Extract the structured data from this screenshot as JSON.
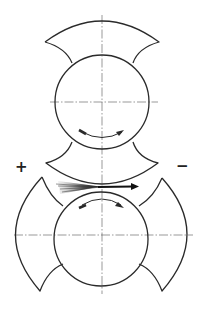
{
  "diagram": {
    "labels": {
      "left_polarity": "+",
      "right_polarity": "−"
    },
    "colors": {
      "line": "#2a2a2a",
      "centerline": "#555555",
      "background": "#ffffff"
    },
    "upper_roll": {
      "cx": 102,
      "cy": 102,
      "r": 47,
      "rotation": "clockwise-bottom-arrow"
    },
    "lower_roll": {
      "cx": 101,
      "cy": 235,
      "r": 47,
      "rotation": "clockwise-top-arrow"
    },
    "feed_arrow": {
      "from_x": 55,
      "to_x": 137,
      "y": 186,
      "direction": "left-to-right"
    }
  }
}
